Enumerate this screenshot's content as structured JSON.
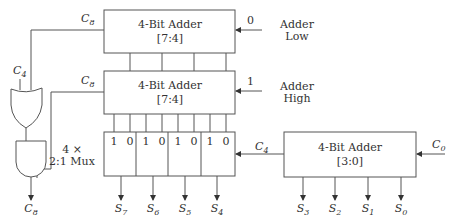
{
  "diagram": {
    "type": "carry-select adder block diagram",
    "adder_low": {
      "title": "4-Bit Adder",
      "range": "[7:4]",
      "carry_in_value": "0",
      "side_label_line1": "Adder",
      "side_label_line2": "Low",
      "carry_out_label": "C",
      "carry_out_sub": "8"
    },
    "adder_high": {
      "title": "4-Bit Adder",
      "range": "[7:4]",
      "carry_in_value": "1",
      "side_label_line1": "Adder",
      "side_label_line2": "High",
      "carry_out_label": "C",
      "carry_out_sub": "8"
    },
    "adder_base": {
      "title": "4-Bit Adder",
      "range": "[3:0]",
      "carry_in_label": "C",
      "carry_in_sub": "0",
      "carry_out_label": "C",
      "carry_out_sub": "4"
    },
    "mux": {
      "label_line1": "4 ×",
      "label_line2": "2:1 Mux",
      "inputs": [
        "1",
        "0",
        "1",
        "0",
        "1",
        "0",
        "1",
        "0"
      ]
    },
    "gates": {
      "or_input_label": "C",
      "or_input_sub": "4",
      "output_label": "C",
      "output_sub": "8"
    },
    "outputs_high": [
      {
        "label": "S",
        "sub": "7"
      },
      {
        "label": "S",
        "sub": "6"
      },
      {
        "label": "S",
        "sub": "5"
      },
      {
        "label": "S",
        "sub": "4"
      }
    ],
    "outputs_low": [
      {
        "label": "S",
        "sub": "3"
      },
      {
        "label": "S",
        "sub": "2"
      },
      {
        "label": "S",
        "sub": "1"
      },
      {
        "label": "S",
        "sub": "0"
      }
    ]
  }
}
